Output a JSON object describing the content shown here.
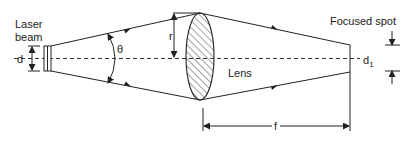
{
  "diagram": {
    "type": "optics-schematic",
    "labels": {
      "laser_beam_line1": "Laser",
      "laser_beam_line2": "beam",
      "beam_diameter": "d",
      "divergence_angle": "θ",
      "lens_radius": "r",
      "lens": "Lens",
      "focused_spot": "Focused spot",
      "spot_diameter": "d",
      "spot_diameter_subscript": "1",
      "focal_length": "f"
    },
    "colors": {
      "stroke": "#222222",
      "background": "#ffffff"
    }
  }
}
